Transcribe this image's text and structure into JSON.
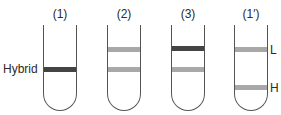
{
  "diagram": {
    "type": "density-gradient-centrifugation-tubes",
    "colors": {
      "dark_band": "#444444",
      "light_band": "#a8a8a8",
      "tube_outline": "#555555"
    },
    "tubes": [
      {
        "label": "(1)",
        "bands": [
          {
            "position": "middle",
            "shade": "dark",
            "label": "Hybrid"
          }
        ]
      },
      {
        "label": "(2)",
        "bands": [
          {
            "position": "upper",
            "shade": "light"
          },
          {
            "position": "middle",
            "shade": "light"
          }
        ]
      },
      {
        "label": "(3)",
        "bands": [
          {
            "position": "upper",
            "shade": "dark"
          },
          {
            "position": "middle",
            "shade": "light"
          }
        ]
      },
      {
        "label": "(1′)",
        "bands": [
          {
            "position": "upper",
            "shade": "light",
            "label": "L"
          },
          {
            "position": "lower",
            "shade": "light",
            "label": "H"
          }
        ]
      }
    ],
    "side_labels": {
      "hybrid": "Hybrid",
      "light": "L",
      "heavy": "H"
    }
  }
}
